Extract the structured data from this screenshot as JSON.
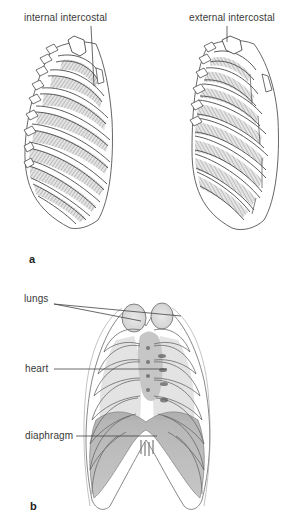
{
  "figure": {
    "panels": [
      {
        "id": "a",
        "letter": "a",
        "description": "Lateral views of the rib cage showing intercostal muscles",
        "labels": [
          {
            "text": "internal intercostal",
            "x": 24,
            "y": 19
          },
          {
            "text": "external intercostal",
            "x": 189,
            "y": 19
          }
        ]
      },
      {
        "id": "b",
        "letter": "b",
        "description": "Anterior view of the thorax showing lungs, heart and diaphragm",
        "labels": [
          {
            "text": "lungs",
            "x": 24,
            "y": 300
          },
          {
            "text": "heart",
            "x": 25,
            "y": 364
          },
          {
            "text": "diaphragm",
            "x": 25,
            "y": 432
          }
        ]
      }
    ],
    "colors": {
      "line": "#4a4a4a",
      "bone": "#ffffff",
      "muscle_shade": "#9a9a9a",
      "organ_shade": "#b8b8b8",
      "diaphragm_shade": "#8f8f8f",
      "label_text": "#3a3a3a"
    }
  }
}
